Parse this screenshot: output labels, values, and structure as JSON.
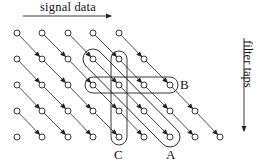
{
  "labels": {
    "horizontal_axis": "signal data",
    "vertical_axis": "filter taps",
    "loop_a": "A",
    "loop_b": "B",
    "loop_c": "C"
  },
  "grid": {
    "rows": 5,
    "row_y": [
      33,
      59,
      85,
      111,
      137
    ],
    "col_x": [
      17,
      42,
      68,
      93,
      119,
      144,
      170,
      195,
      220
    ],
    "row_node_counts": [
      5,
      6,
      7,
      8,
      9
    ],
    "edge_direction": "diagonal down-right from (r,c) to (r+1,c+1)"
  },
  "loops": [
    {
      "name": "A",
      "type": "diagonal",
      "from": [
        1,
        3
      ],
      "to": [
        4,
        6
      ]
    },
    {
      "name": "B",
      "type": "horizontal",
      "row": 2,
      "from_col": 3,
      "to_col": 6
    },
    {
      "name": "C",
      "type": "vertical",
      "col": 4,
      "from_row": 1,
      "to_row": 4
    }
  ],
  "colors": {
    "stroke": "#222222",
    "text": "#111111",
    "background": "#ffffff"
  }
}
